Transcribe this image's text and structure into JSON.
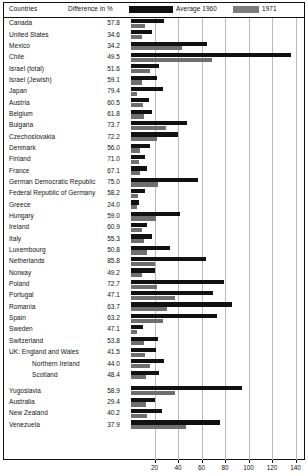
{
  "header": {
    "col_countries": "Countries",
    "col_difference": "Difference in %",
    "legend_1960": "Average 1960",
    "legend_1971": "1971",
    "color_1960": "#111111",
    "color_1971": "#6e6e6e"
  },
  "chart_data": {
    "type": "bar",
    "orientation": "horizontal",
    "title": "",
    "xlabel": "",
    "ylabel": "",
    "xlim": [
      0,
      148
    ],
    "grid": true,
    "gridlines": [
      20,
      40,
      60,
      80,
      100,
      120,
      140
    ],
    "xticks": [
      20,
      40,
      60,
      80,
      100,
      120,
      140
    ],
    "xticklabels": [
      "20",
      "40",
      "60",
      "80",
      "100",
      "120",
      "140"
    ],
    "legend_position": "top",
    "categories": [
      "Canada",
      "United States",
      "Mexico",
      "Chile",
      "Israel (total)",
      "Israel (Jewish)",
      "Japan",
      "Austria",
      "Belgium",
      "Bulgaria",
      "Czechoslovakia",
      "Denmark",
      "Finland",
      "France",
      "German Democratic Republic",
      "Federal Republic of Germany",
      "Greece",
      "Hungary",
      "Ireland",
      "Italy",
      "Luxembourg",
      "Netherlands",
      "Norway",
      "Poland",
      "Portugal",
      "Romania",
      "Spain",
      "Sweden",
      "Switzerland",
      "UK: England and Wales",
      "Northern Ireland",
      "Scotland",
      "Yugoslavia",
      "Australia",
      "New Zealand",
      "Venezuela"
    ],
    "series": [
      {
        "name": "Average 1960",
        "color": "#111111",
        "values": [
          28,
          18,
          65,
          136,
          24,
          22,
          27,
          15,
          18,
          48,
          40,
          16,
          12,
          14,
          57,
          12,
          7,
          42,
          14,
          18,
          33,
          64,
          20,
          79,
          70,
          86,
          73,
          10,
          23,
          21,
          28,
          24,
          94,
          20,
          26,
          76
        ]
      },
      {
        "name": "1971",
        "color": "#6e6e6e",
        "values": [
          12,
          9,
          43,
          69,
          16,
          9,
          5,
          10,
          11,
          30,
          22,
          8,
          7,
          8,
          23,
          6,
          5,
          21,
          9,
          11,
          14,
          20,
          9,
          22,
          37,
          31,
          27,
          5,
          11,
          12,
          16,
          13,
          37,
          13,
          14,
          47
        ]
      }
    ],
    "difference_column": {
      "label": "Difference in %",
      "values": [
        "57.8",
        "34.6",
        "34.2",
        "49.5",
        "51.6",
        "59.1",
        "79.4",
        "60.5",
        "61.8",
        "73.7",
        "72.2",
        "56.0",
        "71.0",
        "67.1",
        "75.0",
        "58.2",
        "24.0",
        "59.0",
        "60.9",
        "55.3",
        "50.8",
        "85.8",
        "49.2",
        "72.7",
        "47.1",
        "63.7",
        "63.2",
        "47.1",
        "53.8",
        "41.5",
        "44.0",
        "48.4",
        "58.9",
        "29.4",
        "40.2",
        "37.9"
      ]
    },
    "indented_rows": [
      "Northern Ireland",
      "Scotland"
    ],
    "group_breaks_after": [
      "Venezuela",
      "Scotland"
    ]
  }
}
